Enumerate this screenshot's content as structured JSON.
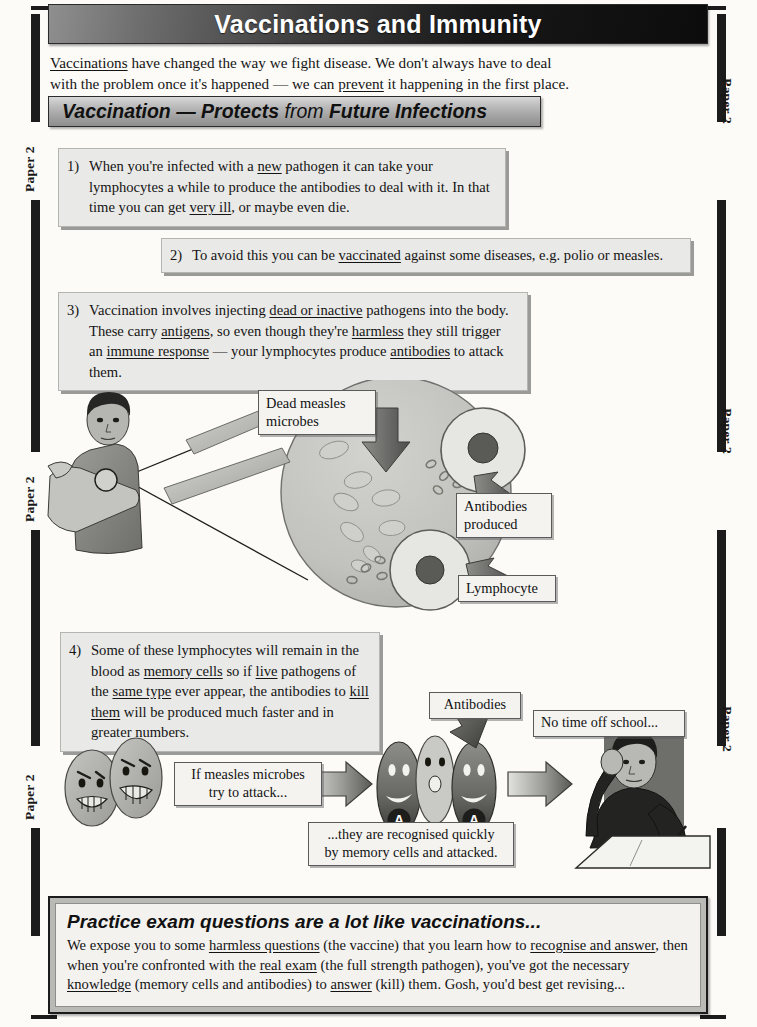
{
  "page": {
    "margin_label": "Paper 2",
    "margin_label_count": 6
  },
  "header": {
    "title": "Vaccinations and Immunity"
  },
  "intro": {
    "line1_a": "Vaccinations",
    "line1_b": " have changed the way we fight disease.  We don't always have to deal",
    "line2_a": "with the problem once it's happened — we can ",
    "line2_b": "prevent",
    "line2_c": " it happening in the first place."
  },
  "section": {
    "title_part1": "Vaccination",
    "title_dash": " — ",
    "title_part2": "Protects",
    "title_part3": " from ",
    "title_part4": "Future Infections"
  },
  "points": [
    {
      "number": "1)",
      "seg": [
        {
          "t": "When you're infected with a ",
          "u": false
        },
        {
          "t": "new",
          "u": true
        },
        {
          "t": " pathogen it can take your lymphocytes a while to produce the antibodies to deal with it. In that time you can get ",
          "u": false
        },
        {
          "t": "very ill",
          "u": true
        },
        {
          "t": ", or maybe even die.",
          "u": false
        }
      ]
    },
    {
      "number": "2)",
      "seg": [
        {
          "t": "To avoid this you can be ",
          "u": false
        },
        {
          "t": "vaccinated",
          "u": true
        },
        {
          "t": " against some diseases, e.g. polio or measles.",
          "u": false
        }
      ]
    },
    {
      "number": "3)",
      "seg": [
        {
          "t": "Vaccination involves injecting ",
          "u": false
        },
        {
          "t": "dead or inactive",
          "u": true
        },
        {
          "t": " pathogens into the body.  These carry ",
          "u": false
        },
        {
          "t": "antigens",
          "u": true
        },
        {
          "t": ", so even though they're ",
          "u": false
        },
        {
          "t": "harmless",
          "u": true
        },
        {
          "t": " they still trigger an ",
          "u": false
        },
        {
          "t": "immune response",
          "u": true
        },
        {
          "t": " — your lymphocytes produce ",
          "u": false
        },
        {
          "t": "antibodies",
          "u": true
        },
        {
          "t": " to attack them.",
          "u": false
        }
      ]
    },
    {
      "number": "4)",
      "seg": [
        {
          "t": "Some of these lymphocytes will remain in the blood as ",
          "u": false
        },
        {
          "t": "memory cells",
          "u": true
        },
        {
          "t": " so if ",
          "u": false
        },
        {
          "t": "live",
          "u": true
        },
        {
          "t": " pathogens of the ",
          "u": false
        },
        {
          "t": "same type",
          "u": true
        },
        {
          "t": " ever appear, the antibodies to ",
          "u": false
        },
        {
          "t": "kill them",
          "u": true
        },
        {
          "t": " will be produced much faster and in greater numbers.",
          "u": false
        }
      ]
    }
  ],
  "diagram1": {
    "label_dead_microbes_line1": "Dead measles",
    "label_dead_microbes_line2": "microbes",
    "label_antibodies_line1": "Antibodies",
    "label_antibodies_line2": "produced",
    "label_lymphocyte": "Lymphocyte"
  },
  "diagram2": {
    "caption_attack_line1": "If measles microbes",
    "caption_attack_line2": "try to attack...",
    "label_antibodies": "Antibodies",
    "caption_recognised_line1": "...they are recognised quickly",
    "caption_recognised_line2": "by memory cells and attacked.",
    "label_school": "No time off school...",
    "antibody_letter": "A"
  },
  "practice": {
    "title": "Practice exam questions are a lot like vaccinations...",
    "seg": [
      {
        "t": "We expose you to some ",
        "u": false
      },
      {
        "t": "harmless questions",
        "u": true
      },
      {
        "t": " (the vaccine) that you learn how to ",
        "u": false
      },
      {
        "t": "recognise and answer",
        "u": true
      },
      {
        "t": ", then when you're confronted with the ",
        "u": false
      },
      {
        "t": "real exam",
        "u": true
      },
      {
        "t": " (the full strength pathogen), you've got the necessary ",
        "u": false
      },
      {
        "t": "knowledge",
        "u": true
      },
      {
        "t": " (memory cells and antibodies) to ",
        "u": false
      },
      {
        "t": "answer",
        "u": true
      },
      {
        "t": " (kill) them.  Gosh, you'd best get revising...",
        "u": false
      }
    ]
  },
  "colors": {
    "ink": "#141414",
    "banner_dark": "#0c0c0c",
    "banner_grey": "#8f8f8f",
    "box_fill": "#e9e9e7",
    "cell_fill": "#b9b9b6"
  }
}
